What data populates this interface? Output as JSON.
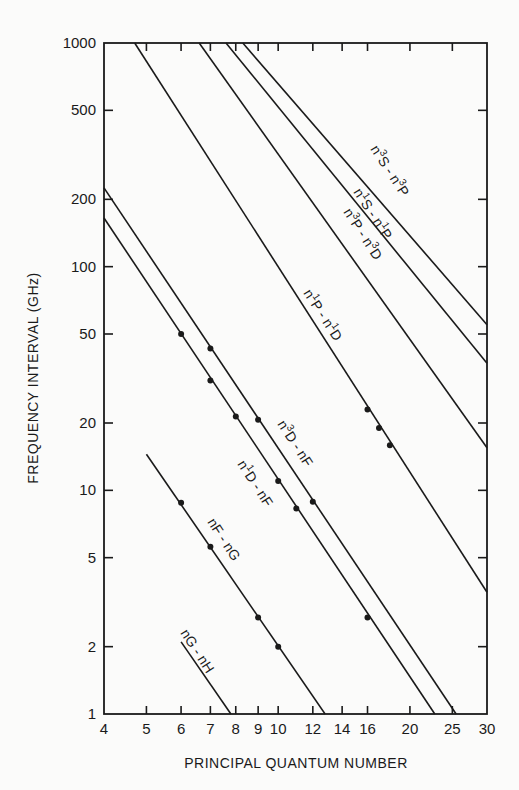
{
  "chart_data": {
    "type": "line",
    "title": "",
    "xlabel": "PRINCIPAL QUANTUM NUMBER",
    "ylabel": "FREQUENCY INTERVAL (GHz)",
    "xscale": "log",
    "yscale": "log",
    "xlim": [
      4,
      30
    ],
    "ylim": [
      1,
      1000
    ],
    "grid": false,
    "legend": "none (inline line labels)",
    "x_ticks": [
      4,
      5,
      6,
      7,
      8,
      9,
      10,
      12,
      14,
      16,
      20,
      25,
      30
    ],
    "x_tick_labels": [
      "4",
      "5",
      "6",
      "7",
      "8",
      "9",
      "10",
      "12",
      "14",
      "16",
      "20",
      "25",
      "30"
    ],
    "y_ticks": [
      1,
      2,
      5,
      10,
      20,
      50,
      100,
      200,
      500,
      1000
    ],
    "y_tick_labels": [
      "1",
      "2",
      "5",
      "10",
      "20",
      "50",
      "100",
      "200",
      "500",
      "1000"
    ],
    "series": [
      {
        "name": "n3S-n3P",
        "label_main": "n",
        "label_sup1": "3",
        "label_mid": "S - n",
        "label_sup2": "3",
        "label_end": "P",
        "line": [
          {
            "n": 8.3,
            "ghz": 1000
          },
          {
            "n": 30,
            "ghz": 55
          }
        ],
        "points": []
      },
      {
        "name": "n1S-n1P",
        "label_main": "n",
        "label_sup1": "1",
        "label_mid": "S - n",
        "label_sup2": "1",
        "label_end": "P",
        "line": [
          {
            "n": 7.6,
            "ghz": 1000
          },
          {
            "n": 30,
            "ghz": 37
          }
        ],
        "points": []
      },
      {
        "name": "n3P-n3D",
        "label_main": "n",
        "label_sup1": "3",
        "label_mid": "P - n",
        "label_sup2": "3",
        "label_end": "D",
        "line": [
          {
            "n": 6.6,
            "ghz": 1000
          },
          {
            "n": 30,
            "ghz": 15.5
          }
        ],
        "points": []
      },
      {
        "name": "n1P-n1D",
        "label_main": "n",
        "label_sup1": "1",
        "label_mid": "P - n",
        "label_sup2": "1",
        "label_end": "D",
        "line": [
          {
            "n": 4.7,
            "ghz": 1000
          },
          {
            "n": 30,
            "ghz": 3.5
          }
        ],
        "points": [
          {
            "n": 16,
            "ghz": 23
          },
          {
            "n": 17,
            "ghz": 19
          },
          {
            "n": 18,
            "ghz": 15.9
          }
        ]
      },
      {
        "name": "n3D-nF",
        "label_main": "n",
        "label_sup1": "3",
        "label_mid": "D - nF",
        "label_sup2": "",
        "label_end": "",
        "line": [
          {
            "n": 4,
            "ghz": 225
          },
          {
            "n": 25.5,
            "ghz": 1
          }
        ],
        "points": [
          {
            "n": 7,
            "ghz": 43
          },
          {
            "n": 9,
            "ghz": 20.7
          },
          {
            "n": 12,
            "ghz": 8.9
          }
        ]
      },
      {
        "name": "n1D-nF",
        "label_main": "n",
        "label_sup1": "1",
        "label_mid": "D - nF",
        "label_sup2": "",
        "label_end": "",
        "line": [
          {
            "n": 4,
            "ghz": 165
          },
          {
            "n": 22.8,
            "ghz": 1
          }
        ],
        "points": [
          {
            "n": 6,
            "ghz": 50
          },
          {
            "n": 7,
            "ghz": 31
          },
          {
            "n": 8,
            "ghz": 21.4
          },
          {
            "n": 10,
            "ghz": 11
          },
          {
            "n": 11,
            "ghz": 8.3
          },
          {
            "n": 16,
            "ghz": 2.7
          }
        ]
      },
      {
        "name": "nF-nG",
        "label_main": "nF - nG",
        "label_sup1": "",
        "label_mid": "",
        "label_sup2": "",
        "label_end": "",
        "line": [
          {
            "n": 5,
            "ghz": 14.5
          },
          {
            "n": 12.8,
            "ghz": 1
          }
        ],
        "points": [
          {
            "n": 6,
            "ghz": 8.8
          },
          {
            "n": 7,
            "ghz": 5.6
          },
          {
            "n": 9,
            "ghz": 2.7
          },
          {
            "n": 10,
            "ghz": 2.0
          }
        ]
      },
      {
        "name": "nG-nH",
        "label_main": "nG - nH",
        "label_sup1": "",
        "label_mid": "",
        "label_sup2": "",
        "label_end": "",
        "line": [
          {
            "n": 6.0,
            "ghz": 2.1
          },
          {
            "n": 7.8,
            "ghz": 1
          }
        ],
        "points": []
      }
    ]
  },
  "axes": {
    "x_title": "PRINCIPAL QUANTUM NUMBER",
    "y_title": "FREQUENCY INTERVAL (GHz)"
  },
  "labels": {
    "n3S_n3P": {
      "a": "n",
      "s1": "3",
      "b": "S - n",
      "s2": "3",
      "c": "P"
    },
    "n1S_n1P": {
      "a": "n",
      "s1": "1",
      "b": "S - n",
      "s2": "1",
      "c": "P"
    },
    "n3P_n3D": {
      "a": "n",
      "s1": "3",
      "b": "P - n",
      "s2": "3",
      "c": "D"
    },
    "n1P_n1D": {
      "a": "n",
      "s1": "1",
      "b": "P - n",
      "s2": "1",
      "c": "D"
    },
    "n3D_nF": {
      "a": "n",
      "s1": "3",
      "b": "D - nF"
    },
    "n1D_nF": {
      "a": "n",
      "s1": "1",
      "b": "D - nF"
    },
    "nF_nG": {
      "a": "nF - nG"
    },
    "nG_nH": {
      "a": "nG - nH"
    }
  }
}
